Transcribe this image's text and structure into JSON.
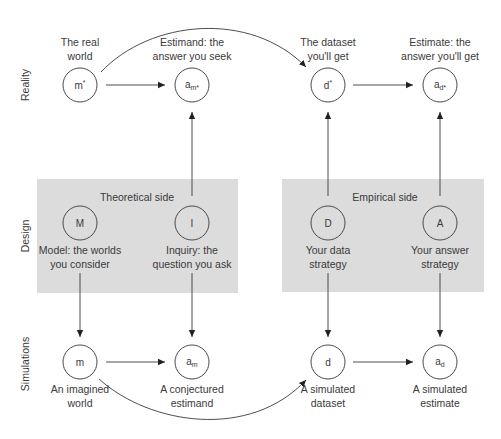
{
  "rows": {
    "reality": "Reality",
    "design": "Design",
    "simulations": "Simulations"
  },
  "panels": {
    "theoretical": {
      "title": "Theoretical side",
      "color": "#dcdcdc"
    },
    "empirical": {
      "title": "Empirical side",
      "color": "#dcdcdc"
    }
  },
  "nodes": {
    "m_star": {
      "symbol": "m",
      "sup": "*",
      "caption": [
        "The real",
        "world"
      ]
    },
    "a_m_star": {
      "symbol": "a",
      "sub": "m*",
      "caption": [
        "Estimand: the",
        "answer you seek"
      ]
    },
    "d_star": {
      "symbol": "d",
      "sup": "*",
      "caption": [
        "The dataset",
        "you'll get"
      ]
    },
    "a_d_star": {
      "symbol": "a",
      "sub": "d*",
      "caption": [
        "Estimate: the",
        "answer you'll get"
      ]
    },
    "M": {
      "symbol": "M",
      "caption": [
        "Model: the worlds",
        "you consider"
      ]
    },
    "I": {
      "symbol": "I",
      "caption": [
        "Inquiry: the",
        "question you ask"
      ]
    },
    "D": {
      "symbol": "D",
      "caption": [
        "Your data",
        "strategy"
      ]
    },
    "A": {
      "symbol": "A",
      "caption": [
        "Your answer",
        "strategy"
      ]
    },
    "m": {
      "symbol": "m",
      "caption": [
        "An imagined",
        "world"
      ]
    },
    "a_m": {
      "symbol": "a",
      "sub": "m",
      "caption": [
        "A conjectured",
        "estimand"
      ]
    },
    "d": {
      "symbol": "d",
      "caption": [
        "A simulated",
        "dataset"
      ]
    },
    "a_d": {
      "symbol": "a",
      "sub": "d",
      "caption": [
        "A simulated",
        "estimate"
      ]
    }
  },
  "edges": [
    {
      "from": "m_star",
      "to": "a_m_star",
      "type": "straight"
    },
    {
      "from": "m_star",
      "to": "d_star",
      "type": "curve-top"
    },
    {
      "from": "d_star",
      "to": "a_d_star",
      "type": "straight"
    },
    {
      "from": "I",
      "to": "a_m_star",
      "type": "straight"
    },
    {
      "from": "D",
      "to": "d_star",
      "type": "straight"
    },
    {
      "from": "A",
      "to": "a_d_star",
      "type": "straight"
    },
    {
      "from": "M",
      "to": "m",
      "type": "straight"
    },
    {
      "from": "I",
      "to": "a_m",
      "type": "straight"
    },
    {
      "from": "D",
      "to": "d",
      "type": "straight"
    },
    {
      "from": "A",
      "to": "a_d",
      "type": "straight"
    },
    {
      "from": "m",
      "to": "a_m",
      "type": "straight"
    },
    {
      "from": "m",
      "to": "d",
      "type": "curve-bottom"
    },
    {
      "from": "d",
      "to": "a_d",
      "type": "straight"
    }
  ]
}
